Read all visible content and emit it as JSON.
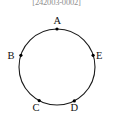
{
  "header": {
    "id_text": "[242003-0002]"
  },
  "figure": {
    "name": "circle-with-five-points",
    "stroke_color": "#1a1a1a",
    "fill_color": "#ffffff",
    "point_color": "#000000",
    "circle": {
      "cx": 57,
      "cy": 67,
      "r": 38
    },
    "points": [
      {
        "label": "A",
        "angle_deg": 90,
        "x": 57.0,
        "y": 29.0,
        "label_x": 53.5,
        "label_y": 15.5
      },
      {
        "label": "B",
        "angle_deg": 162,
        "x": 20.9,
        "y": 55.3,
        "label_x": 7.5,
        "label_y": 50.5
      },
      {
        "label": "C",
        "angle_deg": 242,
        "x": 39.2,
        "y": 100.6,
        "label_x": 32.5,
        "label_y": 103.0
      },
      {
        "label": "D",
        "angle_deg": 297,
        "x": 74.3,
        "y": 100.9,
        "label_x": 70.5,
        "label_y": 103.0
      },
      {
        "label": "E",
        "angle_deg": 18,
        "x": 93.1,
        "y": 55.3,
        "label_x": 96.0,
        "label_y": 50.5
      }
    ]
  }
}
